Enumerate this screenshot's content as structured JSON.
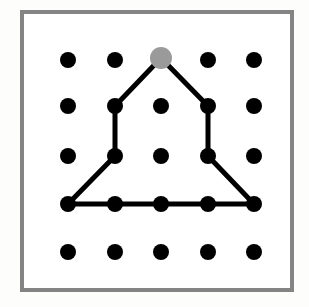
{
  "figure": {
    "canvas": {
      "width": 309,
      "height": 307
    },
    "background_color": "#fdfdfb"
  },
  "frame": {
    "name": "outer-frame",
    "x": 22,
    "y": 12,
    "width": 270,
    "height": 278,
    "stroke_color": "#848484",
    "stroke_width": 4,
    "fill_color": "#ffffff"
  },
  "grid": {
    "rows": 5,
    "cols": 5,
    "col_x": [
      68,
      115,
      161,
      208,
      254
    ],
    "row_y": [
      60,
      106,
      156,
      204,
      252
    ],
    "dot_color": "#000000",
    "dot_radius": 8,
    "highlight_dot_color": "#9a9a9a",
    "highlight_dot_radius": 11,
    "highlight_point": {
      "col": 3,
      "row": 1,
      "x": 161,
      "y": 58
    }
  },
  "dots": [
    {
      "id": "dot-r1c1",
      "col": 1,
      "row": 1,
      "x": 68,
      "y": 60,
      "color": "#000000",
      "radius": 8
    },
    {
      "id": "dot-r1c2",
      "col": 2,
      "row": 1,
      "x": 115,
      "y": 60,
      "color": "#000000",
      "radius": 8
    },
    {
      "id": "dot-r1c3",
      "col": 3,
      "row": 1,
      "x": 161,
      "y": 58,
      "color": "#9a9a9a",
      "radius": 11
    },
    {
      "id": "dot-r1c4",
      "col": 4,
      "row": 1,
      "x": 208,
      "y": 60,
      "color": "#000000",
      "radius": 8
    },
    {
      "id": "dot-r1c5",
      "col": 5,
      "row": 1,
      "x": 254,
      "y": 60,
      "color": "#000000",
      "radius": 8
    },
    {
      "id": "dot-r2c1",
      "col": 1,
      "row": 2,
      "x": 68,
      "y": 106,
      "color": "#000000",
      "radius": 8
    },
    {
      "id": "dot-r2c2",
      "col": 2,
      "row": 2,
      "x": 115,
      "y": 106,
      "color": "#000000",
      "radius": 8
    },
    {
      "id": "dot-r2c3",
      "col": 3,
      "row": 2,
      "x": 161,
      "y": 106,
      "color": "#000000",
      "radius": 8
    },
    {
      "id": "dot-r2c4",
      "col": 4,
      "row": 2,
      "x": 208,
      "y": 106,
      "color": "#000000",
      "radius": 8
    },
    {
      "id": "dot-r2c5",
      "col": 5,
      "row": 2,
      "x": 254,
      "y": 106,
      "color": "#000000",
      "radius": 8
    },
    {
      "id": "dot-r3c1",
      "col": 1,
      "row": 3,
      "x": 68,
      "y": 156,
      "color": "#000000",
      "radius": 8
    },
    {
      "id": "dot-r3c2",
      "col": 2,
      "row": 3,
      "x": 115,
      "y": 156,
      "color": "#000000",
      "radius": 8
    },
    {
      "id": "dot-r3c3",
      "col": 3,
      "row": 3,
      "x": 161,
      "y": 156,
      "color": "#000000",
      "radius": 8
    },
    {
      "id": "dot-r3c4",
      "col": 4,
      "row": 3,
      "x": 208,
      "y": 156,
      "color": "#000000",
      "radius": 8
    },
    {
      "id": "dot-r3c5",
      "col": 5,
      "row": 3,
      "x": 254,
      "y": 156,
      "color": "#000000",
      "radius": 8
    },
    {
      "id": "dot-r4c1",
      "col": 1,
      "row": 4,
      "x": 68,
      "y": 204,
      "color": "#000000",
      "radius": 8
    },
    {
      "id": "dot-r4c2",
      "col": 2,
      "row": 4,
      "x": 115,
      "y": 204,
      "color": "#000000",
      "radius": 8
    },
    {
      "id": "dot-r4c3",
      "col": 3,
      "row": 4,
      "x": 161,
      "y": 204,
      "color": "#000000",
      "radius": 8
    },
    {
      "id": "dot-r4c4",
      "col": 4,
      "row": 4,
      "x": 208,
      "y": 204,
      "color": "#000000",
      "radius": 8
    },
    {
      "id": "dot-r4c5",
      "col": 5,
      "row": 4,
      "x": 254,
      "y": 204,
      "color": "#000000",
      "radius": 8
    },
    {
      "id": "dot-r5c1",
      "col": 1,
      "row": 5,
      "x": 68,
      "y": 252,
      "color": "#000000",
      "radius": 8
    },
    {
      "id": "dot-r5c2",
      "col": 2,
      "row": 5,
      "x": 115,
      "y": 252,
      "color": "#000000",
      "radius": 8
    },
    {
      "id": "dot-r5c3",
      "col": 3,
      "row": 5,
      "x": 161,
      "y": 252,
      "color": "#000000",
      "radius": 8
    },
    {
      "id": "dot-r5c4",
      "col": 4,
      "row": 5,
      "x": 208,
      "y": 252,
      "color": "#000000",
      "radius": 8
    },
    {
      "id": "dot-r5c5",
      "col": 5,
      "row": 5,
      "x": 254,
      "y": 252,
      "color": "#000000",
      "radius": 8
    }
  ],
  "polygon": {
    "name": "house-pentagon",
    "stroke_color": "#000000",
    "stroke_width": 5,
    "fill_color": "none",
    "closed": true,
    "vertices": [
      {
        "label": "apex",
        "col": 3,
        "row": 1,
        "x": 161,
        "y": 58
      },
      {
        "label": "upper-right",
        "col": 4,
        "row": 2,
        "x": 208,
        "y": 106
      },
      {
        "label": "mid-right",
        "col": 4,
        "row": 3,
        "x": 208,
        "y": 156
      },
      {
        "label": "base-right",
        "col": 5,
        "row": 4,
        "x": 254,
        "y": 204
      },
      {
        "label": "base-left",
        "col": 1,
        "row": 4,
        "x": 68,
        "y": 204
      },
      {
        "label": "mid-left",
        "col": 2,
        "row": 3,
        "x": 115,
        "y": 156
      },
      {
        "label": "upper-left",
        "col": 2,
        "row": 2,
        "x": 115,
        "y": 106
      }
    ],
    "points_string": "161,58 208,106 208,156 254,204 68,204 115,156 115,106"
  }
}
